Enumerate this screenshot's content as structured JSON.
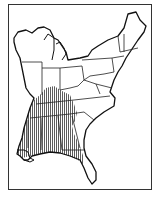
{
  "map": {
    "region": "Eastern United States",
    "type": "species range map",
    "legend": [],
    "colors": {
      "outline": "#1a1a1a",
      "hatch": "#333333",
      "background": "#ffffff",
      "frame": "#333333"
    },
    "range": {
      "pattern": "vertical hatching",
      "states_covered": [
        "Mississippi",
        "Alabama",
        "Tennessee",
        "Kentucky (south)",
        "Georgia (west)",
        "Florida panhandle",
        "Louisiana (east)",
        "Arkansas (east)"
      ]
    }
  }
}
